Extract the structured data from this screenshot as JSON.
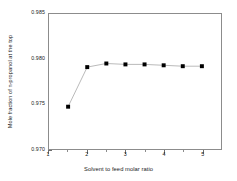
{
  "chart_data": {
    "type": "line",
    "title": "",
    "xlabel": "Solvent to feed molar ratio",
    "ylabel": "Mole fraction of n-propanol at the top",
    "xlim": [
      1,
      5.5
    ],
    "ylim": [
      0.97,
      0.985
    ],
    "xticks": [
      1,
      2,
      3,
      4,
      5
    ],
    "xtick_labels": [
      "1",
      "2",
      "3",
      "4",
      "5"
    ],
    "xminor_ticks": [
      1.5,
      2.5,
      3.5,
      4.5
    ],
    "yticks": [
      0.97,
      0.975,
      0.98,
      0.985
    ],
    "ytick_labels": [
      "0.970",
      "0.975",
      "0.980",
      "0.985"
    ],
    "yminor_ticks": [
      0.9725,
      0.9775,
      0.9825
    ],
    "grid": false,
    "legend": null,
    "marker": "filled-square",
    "marker_color": "#000000",
    "line_color": "#9a9a9a",
    "series": [
      {
        "name": "Mole fraction of n-propanol at the top",
        "x": [
          1.5,
          2.0,
          2.5,
          3.0,
          3.5,
          4.0,
          4.5,
          5.0
        ],
        "values": [
          0.9747,
          0.9791,
          0.9795,
          0.9794,
          0.9794,
          0.9793,
          0.9792,
          0.9792
        ]
      }
    ]
  },
  "axes": {
    "y_title": "Mole fraction of n-propanol at the top",
    "x_title": "Solvent to feed molar ratio"
  }
}
